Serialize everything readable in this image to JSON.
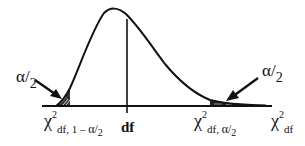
{
  "diagram": {
    "colors": {
      "stroke": "#111111",
      "shade": "#222222",
      "background": "#ffffff"
    },
    "labels": {
      "left_tail_area": {
        "alpha": "α",
        "slash": "/",
        "den": "2"
      },
      "right_tail_area": {
        "alpha": "α",
        "slash": "/",
        "den": "2"
      },
      "left_critical": {
        "chi": "χ",
        "sup": "2",
        "sub_prefix": "df, 1 – ",
        "sub_alpha": "α",
        "sub_slash": "/",
        "sub_den": "2"
      },
      "center": "df",
      "right_critical": {
        "chi": "χ",
        "sup": "2",
        "sub_prefix": "df, ",
        "sub_alpha": "α",
        "sub_slash": "/",
        "sub_den": "2"
      },
      "axis": {
        "chi": "χ",
        "sup": "2",
        "sub": "df"
      }
    },
    "curve": {
      "type": "chi-square density (right-skewed)",
      "baseline_y": 106,
      "axis_x_start": 42,
      "axis_x_end": 272,
      "peak": [
        112,
        10
      ],
      "df_line_x": 127
    },
    "shaded_regions": [
      {
        "name": "left-tail",
        "x_from": 55,
        "x_to": 70
      },
      {
        "name": "right-tail",
        "x_from": 210,
        "x_to": 266
      }
    ]
  }
}
